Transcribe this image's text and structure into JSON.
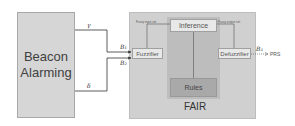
{
  "diagram": {
    "source_block": {
      "label_line1": "Beacon",
      "label_line2": "Alarming"
    },
    "system": {
      "label": "FAIR",
      "blocks": {
        "fuzzifier": "Fuzzifier",
        "inference": "Inference",
        "rules": "Rules",
        "defuzzifier": "Defuzzifier"
      },
      "edge_labels": {
        "fuzzy_input": "Fuzzy input set",
        "fuzzy_output": "Fuzzy output set"
      }
    },
    "signals": {
      "gamma": "γ",
      "delta": "δ",
      "b1": "B₁",
      "b2": "B₂",
      "b3": "B₃",
      "output": "PRS"
    },
    "colors": {
      "source_fill": "#d6d6d6",
      "system_fill": "#d0d0d0",
      "core_fill": "#bdbdbd",
      "rules_fill": "#a9a9a9",
      "block_fill": "#e8e8e8",
      "line": "#333333"
    }
  }
}
